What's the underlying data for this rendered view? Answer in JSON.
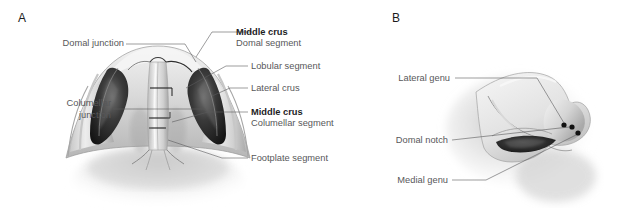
{
  "figure": {
    "type": "anatomical-illustration",
    "background_color": "#ffffff",
    "label_color": "#58585a",
    "emphasis_color": "#1d1d1f",
    "leader_line_color": "#5a5a5c"
  },
  "panels": [
    {
      "letter": "A",
      "view": "basal (worm's-eye) view of nose",
      "labels": {
        "domal_junction": "Domal junction",
        "columellar_junction_line1": "Columellar",
        "columellar_junction_line2": "junction",
        "middle_crus_top": "Middle crus",
        "domal_segment": "Domal segment",
        "lobular_segment": "Lobular segment",
        "lateral_crus": "Lateral crus",
        "middle_crus_lower": "Middle crus",
        "columellar_segment": "Columellar segment",
        "footplate_segment": "Footplate segment"
      }
    },
    {
      "letter": "B",
      "view": "lateral (profile) view of nose",
      "labels": {
        "lateral_genu": "Lateral genu",
        "domal_notch": "Domal notch",
        "medial_genu": "Medial genu"
      },
      "markers": [
        {
          "name": "lateral-genu-dot"
        },
        {
          "name": "domal-notch-dot"
        },
        {
          "name": "medial-genu-dot"
        }
      ]
    }
  ]
}
